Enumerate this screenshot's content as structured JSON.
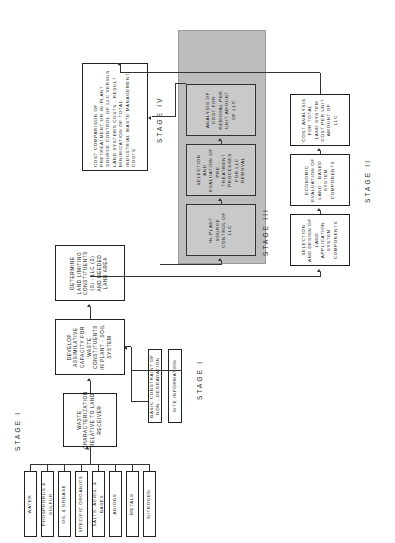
{
  "figure": {
    "orientation": "rotated-90-ccw",
    "stage_labels": {
      "stage1_top": "STAGE I",
      "stage1_bottom": "STAGE I",
      "stage2": "STAGE II",
      "stage3": "STAGE III",
      "stage4": "STAGE IV"
    },
    "waste_constituents": [
      "WATER",
      "PHOSPHORUS & SULFUR",
      "OIL & GREASE",
      "SPECIFIC ORGANICS",
      "SALTS, ACIDS, & BASES",
      "ANIONS",
      "METALS",
      "NITROGEN"
    ],
    "stage1_inputs": [
      "BASIC CONSTRAINT OF NON - DEGRADATION",
      "SITE INFORMATION"
    ],
    "stage1_main": [
      "WASTE CHARACTERIZATION RELATIVE TO LAND RECEIVER",
      "DEVELOP ASSIMILATIVE CAPACITY FOR WASTE CONSTITUENTS IN PLANT - SOIL SYSTEM",
      "DETERMINE LAND LIMITING CONSTITUENTS (S) - LLC (S) AND NEEDED LAND AREA"
    ],
    "stage2_boxes": [
      "SELECTION AND DESIGN OF LAND APPLICATION SYSTEM COMPONENTS",
      "ECONOMIC EVALUATION OF LAND - BASED SYSTEM COMPONENTS",
      "COST ANALYSIS FOR TOTAL LAND SYSTEM COST PER UNIT AMOUNT OF LLC"
    ],
    "stage3_boxes": [
      "IN-PLANT SOURCE CONTROL OF LLC",
      "SELECTION AND EVALUATION OF PRE - TREATMENT PROCESSES FOR LLC REMOVAL",
      "ANALYSIS OF COST FOR REMOVAL PER UNIT AMOUNT OF LLC"
    ],
    "stage4_box": "COST COMPARISON OF PRETREATMENT OR IN-PLANT SOURCE CONTROL OF LLC VERSUS LAND SYSTEMS COSTS - RESULT MINIMIZATION OF TOTAL INDUSTRIAL WASTE MANAGEMENT COSTS",
    "colors": {
      "box_border": "#222222",
      "stage3_panel": "#bdbdbd",
      "stage3_box": "#c9c9c9",
      "line": "#333333",
      "background": "#ffffff"
    }
  }
}
